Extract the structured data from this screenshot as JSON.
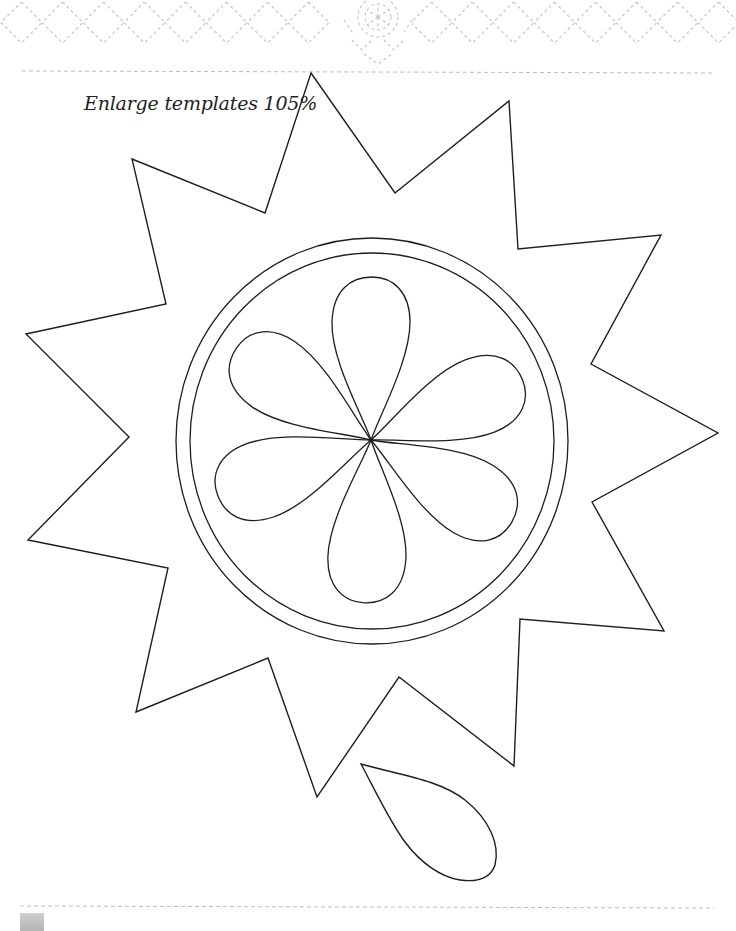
{
  "page": {
    "caption": "Enlarge templates 105%",
    "colors": {
      "outline": "#1e1e1e",
      "border_pattern": "#c4c4c4",
      "dashed_rule": "#bdbdbd",
      "background": "#ffffff"
    }
  },
  "header_border": {
    "pattern": "dashed diamond lattice",
    "medallion": "dashed flower medallion (center)"
  },
  "template": {
    "star_points": 12,
    "star_polygon": [
      [
        311,
        73
      ],
      [
        395,
        193
      ],
      [
        509,
        101
      ],
      [
        518,
        249
      ],
      [
        661,
        235
      ],
      [
        591,
        364
      ],
      [
        718,
        433
      ],
      [
        592,
        502
      ],
      [
        664,
        631
      ],
      [
        520,
        619
      ],
      [
        514,
        766
      ],
      [
        399,
        677
      ],
      [
        317,
        797
      ],
      [
        268,
        658
      ],
      [
        136,
        712
      ],
      [
        168,
        568
      ],
      [
        28,
        540
      ],
      [
        129,
        437
      ],
      [
        26,
        334
      ],
      [
        166,
        304
      ],
      [
        132,
        159
      ],
      [
        265,
        213
      ]
    ],
    "circle_center": [
      372,
      441
    ],
    "outer_ring_radius": 201,
    "inner_ring_radius": 185,
    "flower_center": [
      371,
      440
    ],
    "petal_count": 6,
    "petal_angles_deg": [
      -90,
      -22,
      30,
      92,
      160,
      -146
    ],
    "petal_length": 163,
    "petal_width": 78,
    "loose_petal": "teardrop template below star"
  },
  "footer": {
    "page_tab": "page number tab"
  }
}
